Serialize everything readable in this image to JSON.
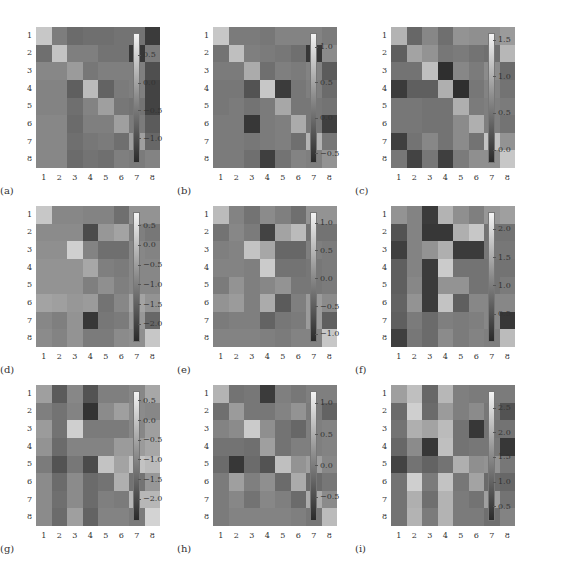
{
  "chart_data": [
    {
      "type": "heatmap",
      "label": "(a)",
      "xticks": [
        "1",
        "2",
        "3",
        "4",
        "5",
        "6",
        "7",
        "8"
      ],
      "yticks": [
        "1",
        "2",
        "3",
        "4",
        "5",
        "6",
        "7",
        "8"
      ],
      "colorbar": {
        "min": -1.4,
        "max": 0.9,
        "ticks": [
          0.5,
          0.0,
          -0.5,
          -1.0
        ],
        "tick_labels": [
          "0.5",
          "0.0",
          "−0.5",
          "−1.0"
        ]
      },
      "brightness": [
        [
          0.82,
          0.45,
          0.36,
          0.38,
          0.38,
          0.4,
          0.4,
          0.12
        ],
        [
          0.38,
          0.8,
          0.46,
          0.46,
          0.4,
          0.4,
          0.1,
          0.44
        ],
        [
          0.5,
          0.5,
          0.6,
          0.42,
          0.46,
          0.46,
          0.46,
          0.22
        ],
        [
          0.48,
          0.48,
          0.3,
          0.76,
          0.32,
          0.44,
          0.46,
          0.16
        ],
        [
          0.48,
          0.48,
          0.38,
          0.48,
          0.62,
          0.42,
          0.4,
          0.16
        ],
        [
          0.5,
          0.5,
          0.36,
          0.46,
          0.46,
          0.62,
          0.44,
          0.28
        ],
        [
          0.5,
          0.5,
          0.38,
          0.42,
          0.44,
          0.38,
          0.62,
          0.34
        ],
        [
          0.5,
          0.5,
          0.36,
          0.4,
          0.38,
          0.46,
          0.44,
          0.48
        ]
      ]
    },
    {
      "type": "heatmap",
      "label": "(b)",
      "xticks": [
        "1",
        "2",
        "3",
        "4",
        "5",
        "6",
        "7",
        "8"
      ],
      "yticks": [
        "1",
        "2",
        "3",
        "4",
        "5",
        "6",
        "7",
        "8"
      ],
      "colorbar": {
        "min": -0.6,
        "max": 1.2,
        "ticks": [
          1.0,
          0.5,
          0.0,
          -0.5
        ],
        "tick_labels": [
          "1.0",
          "0.5",
          "0.0",
          "−0.5"
        ]
      },
      "brightness": [
        [
          0.82,
          0.44,
          0.44,
          0.42,
          0.48,
          0.48,
          0.48,
          0.44
        ],
        [
          0.4,
          0.78,
          0.46,
          0.44,
          0.42,
          0.38,
          0.1,
          0.52
        ],
        [
          0.44,
          0.44,
          0.68,
          0.38,
          0.46,
          0.44,
          0.48,
          0.28
        ],
        [
          0.42,
          0.42,
          0.24,
          0.82,
          0.12,
          0.42,
          0.46,
          0.36
        ],
        [
          0.42,
          0.44,
          0.4,
          0.44,
          0.66,
          0.42,
          0.42,
          0.4
        ],
        [
          0.44,
          0.44,
          0.1,
          0.44,
          0.46,
          0.68,
          0.42,
          0.14
        ],
        [
          0.44,
          0.44,
          0.42,
          0.44,
          0.46,
          0.38,
          0.72,
          0.42
        ],
        [
          0.44,
          0.44,
          0.38,
          0.14,
          0.4,
          0.48,
          0.46,
          0.56
        ]
      ]
    },
    {
      "type": "heatmap",
      "label": "(c)",
      "xticks": [
        "1",
        "2",
        "3",
        "4",
        "5",
        "6",
        "7",
        "8"
      ],
      "yticks": [
        "1",
        "2",
        "3",
        "4",
        "5",
        "6",
        "7",
        "8"
      ],
      "colorbar": {
        "min": -0.15,
        "max": 1.6,
        "ticks": [
          1.5,
          1.0,
          0.5,
          0.0
        ],
        "tick_labels": [
          "1.5",
          "1.0",
          "0.5",
          "0.0"
        ]
      },
      "brightness": [
        [
          0.72,
          0.34,
          0.5,
          0.38,
          0.56,
          0.54,
          0.54,
          0.6
        ],
        [
          0.3,
          0.64,
          0.56,
          0.42,
          0.44,
          0.4,
          0.38,
          0.74
        ],
        [
          0.4,
          0.4,
          0.78,
          0.06,
          0.5,
          0.44,
          0.52,
          0.36
        ],
        [
          0.12,
          0.3,
          0.3,
          0.7,
          0.06,
          0.42,
          0.48,
          0.4
        ],
        [
          0.42,
          0.42,
          0.4,
          0.4,
          0.7,
          0.44,
          0.46,
          0.44
        ],
        [
          0.42,
          0.42,
          0.4,
          0.4,
          0.52,
          0.7,
          0.46,
          0.4
        ],
        [
          0.14,
          0.4,
          0.5,
          0.4,
          0.52,
          0.4,
          0.8,
          0.56
        ],
        [
          0.42,
          0.16,
          0.42,
          0.14,
          0.44,
          0.54,
          0.54,
          0.82
        ]
      ]
    },
    {
      "type": "heatmap",
      "label": "(d)",
      "xticks": [
        "1",
        "2",
        "3",
        "4",
        "5",
        "6",
        "7",
        "8"
      ],
      "yticks": [
        "1",
        "2",
        "3",
        "4",
        "5",
        "6",
        "7",
        "8"
      ],
      "colorbar": {
        "min": -2.4,
        "max": 0.85,
        "ticks": [
          0.5,
          0.0,
          -0.5,
          -1.0,
          -1.5,
          -2.0
        ],
        "tick_labels": [
          "0.5",
          "0.0",
          "−0.5",
          "−1.0",
          "−1.5",
          "−2.0"
        ]
      },
      "brightness": [
        [
          0.82,
          0.5,
          0.5,
          0.48,
          0.48,
          0.38,
          0.56,
          0.56
        ],
        [
          0.52,
          0.52,
          0.52,
          0.2,
          0.58,
          0.64,
          0.46,
          0.42
        ],
        [
          0.54,
          0.54,
          0.86,
          0.48,
          0.38,
          0.38,
          0.5,
          0.48
        ],
        [
          0.56,
          0.56,
          0.56,
          0.66,
          0.46,
          0.44,
          0.5,
          0.5
        ],
        [
          0.56,
          0.56,
          0.56,
          0.46,
          0.54,
          0.46,
          0.5,
          0.5
        ],
        [
          0.64,
          0.62,
          0.58,
          0.6,
          0.4,
          0.5,
          0.64,
          0.56
        ],
        [
          0.5,
          0.46,
          0.56,
          0.1,
          0.42,
          0.44,
          0.58,
          0.34
        ],
        [
          0.52,
          0.48,
          0.56,
          0.44,
          0.44,
          0.52,
          0.54,
          0.82
        ]
      ]
    },
    {
      "type": "heatmap",
      "label": "(e)",
      "xticks": [
        "1",
        "2",
        "3",
        "4",
        "5",
        "6",
        "7",
        "8"
      ],
      "yticks": [
        "1",
        "2",
        "3",
        "4",
        "5",
        "6",
        "7",
        "8"
      ],
      "colorbar": {
        "min": -1.1,
        "max": 1.2,
        "ticks": [
          1.0,
          0.5,
          0.0,
          -0.5,
          -1.0
        ],
        "tick_labels": [
          "1.0",
          "0.5",
          "0.0",
          "−0.5",
          "−1.0"
        ]
      },
      "brightness": [
        [
          0.76,
          0.48,
          0.4,
          0.52,
          0.46,
          0.38,
          0.56,
          0.56
        ],
        [
          0.4,
          0.5,
          0.44,
          0.16,
          0.64,
          0.76,
          0.4,
          0.4
        ],
        [
          0.46,
          0.48,
          0.8,
          0.66,
          0.34,
          0.34,
          0.46,
          0.44
        ],
        [
          0.48,
          0.48,
          0.46,
          0.84,
          0.4,
          0.4,
          0.42,
          0.44
        ],
        [
          0.44,
          0.56,
          0.46,
          0.5,
          0.56,
          0.42,
          0.42,
          0.44
        ],
        [
          0.56,
          0.6,
          0.46,
          0.68,
          0.28,
          0.46,
          0.6,
          0.52
        ],
        [
          0.44,
          0.46,
          0.46,
          0.32,
          0.42,
          0.44,
          0.6,
          0.3
        ],
        [
          0.48,
          0.48,
          0.48,
          0.46,
          0.44,
          0.48,
          0.48,
          0.82
        ]
      ]
    },
    {
      "type": "heatmap",
      "label": "(f)",
      "xticks": [
        "1",
        "2",
        "3",
        "4",
        "5",
        "6",
        "7",
        "8"
      ],
      "yticks": [
        "1",
        "2",
        "3",
        "4",
        "5",
        "6",
        "7",
        "8"
      ],
      "colorbar": {
        "min": 0.05,
        "max": 2.3,
        "ticks": [
          2.0,
          1.5,
          1.0,
          0.5
        ],
        "tick_labels": [
          "2.0",
          "1.5",
          "1.0",
          "0.5"
        ]
      },
      "brightness": [
        [
          0.56,
          0.48,
          0.12,
          0.72,
          0.54,
          0.46,
          0.58,
          0.62
        ],
        [
          0.24,
          0.48,
          0.1,
          0.1,
          0.7,
          0.82,
          0.4,
          0.4
        ],
        [
          0.14,
          0.48,
          0.56,
          0.7,
          0.12,
          0.12,
          0.42,
          0.42
        ],
        [
          0.3,
          0.48,
          0.12,
          0.84,
          0.4,
          0.4,
          0.4,
          0.4
        ],
        [
          0.3,
          0.5,
          0.12,
          0.56,
          0.56,
          0.4,
          0.4,
          0.44
        ],
        [
          0.32,
          0.56,
          0.12,
          0.8,
          0.3,
          0.5,
          0.5,
          0.5
        ],
        [
          0.3,
          0.44,
          0.36,
          0.46,
          0.44,
          0.46,
          0.5,
          0.1
        ],
        [
          0.14,
          0.42,
          0.36,
          0.52,
          0.44,
          0.48,
          0.46,
          0.76
        ]
      ]
    },
    {
      "type": "heatmap",
      "label": "(g)",
      "xticks": [
        "1",
        "2",
        "3",
        "4",
        "5",
        "6",
        "7",
        "8"
      ],
      "yticks": [
        "1",
        "2",
        "3",
        "4",
        "5",
        "6",
        "7",
        "8"
      ],
      "colorbar": {
        "min": -2.5,
        "max": 0.75,
        "ticks": [
          0.5,
          0.0,
          -0.5,
          -1.0,
          -1.5,
          -2.0
        ],
        "tick_labels": [
          "0.5",
          "0.0",
          "−0.5",
          "−1.0",
          "−1.5",
          "−2.0"
        ]
      },
      "brightness": [
        [
          0.62,
          0.28,
          0.5,
          0.24,
          0.46,
          0.46,
          0.5,
          0.66
        ],
        [
          0.46,
          0.4,
          0.48,
          0.08,
          0.52,
          0.62,
          0.52,
          0.5
        ],
        [
          0.6,
          0.4,
          0.86,
          0.44,
          0.44,
          0.44,
          0.5,
          0.62
        ],
        [
          0.56,
          0.36,
          0.48,
          0.48,
          0.48,
          0.6,
          0.6,
          0.66
        ],
        [
          0.44,
          0.24,
          0.42,
          0.2,
          0.8,
          0.64,
          0.8,
          0.76
        ],
        [
          0.52,
          0.36,
          0.52,
          0.36,
          0.4,
          0.7,
          0.4,
          0.58
        ],
        [
          0.52,
          0.38,
          0.52,
          0.36,
          0.46,
          0.44,
          0.74,
          0.74
        ],
        [
          0.52,
          0.36,
          0.62,
          0.32,
          0.48,
          0.48,
          0.44,
          0.88
        ]
      ]
    },
    {
      "type": "heatmap",
      "label": "(h)",
      "xticks": [
        "1",
        "2",
        "3",
        "4",
        "5",
        "6",
        "7",
        "8"
      ],
      "yticks": [
        "1",
        "2",
        "3",
        "4",
        "5",
        "6",
        "7",
        "8"
      ],
      "colorbar": {
        "min": -0.85,
        "max": 1.2,
        "ticks": [
          1.0,
          0.5,
          0.0,
          -0.5
        ],
        "tick_labels": [
          "1.0",
          "0.5",
          "0.0",
          "−0.5"
        ]
      },
      "brightness": [
        [
          0.72,
          0.4,
          0.42,
          0.12,
          0.46,
          0.42,
          0.46,
          0.46
        ],
        [
          0.38,
          0.6,
          0.42,
          0.42,
          0.48,
          0.56,
          0.44,
          0.32
        ],
        [
          0.48,
          0.52,
          0.84,
          0.54,
          0.4,
          0.34,
          0.46,
          0.48
        ],
        [
          0.4,
          0.4,
          0.38,
          0.62,
          0.4,
          0.46,
          0.46,
          0.48
        ],
        [
          0.36,
          0.1,
          0.36,
          0.24,
          0.78,
          0.56,
          0.62,
          0.5
        ],
        [
          0.44,
          0.62,
          0.46,
          0.54,
          0.36,
          0.68,
          0.36,
          0.42
        ],
        [
          0.44,
          0.5,
          0.4,
          0.5,
          0.46,
          0.36,
          0.68,
          0.52
        ],
        [
          0.44,
          0.48,
          0.48,
          0.48,
          0.48,
          0.46,
          0.42,
          0.76
        ]
      ]
    },
    {
      "type": "heatmap",
      "label": "(i)",
      "xticks": [
        "1",
        "2",
        "3",
        "4",
        "5",
        "6",
        "7",
        "8"
      ],
      "yticks": [
        "1",
        "2",
        "3",
        "4",
        "5",
        "6",
        "7",
        "8"
      ],
      "colorbar": {
        "min": 0.25,
        "max": 2.85,
        "ticks": [
          2.5,
          2.0,
          1.5,
          1.0,
          0.5
        ],
        "tick_labels": [
          "2.5",
          "2.0",
          "1.5",
          "1.0",
          "0.5"
        ]
      },
      "brightness": [
        [
          0.62,
          0.78,
          0.34,
          0.74,
          0.46,
          0.44,
          0.44,
          0.44
        ],
        [
          0.36,
          0.86,
          0.36,
          0.6,
          0.46,
          0.52,
          0.42,
          0.24
        ],
        [
          0.4,
          0.7,
          0.64,
          0.76,
          0.4,
          0.1,
          0.4,
          0.4
        ],
        [
          0.34,
          0.52,
          0.1,
          0.78,
          0.4,
          0.42,
          0.42,
          0.1
        ],
        [
          0.16,
          0.4,
          0.32,
          0.4,
          0.7,
          0.54,
          0.56,
          0.42
        ],
        [
          0.4,
          0.86,
          0.44,
          0.8,
          0.42,
          0.64,
          0.36,
          0.34
        ],
        [
          0.4,
          0.7,
          0.38,
          0.72,
          0.44,
          0.4,
          0.62,
          0.4
        ],
        [
          0.4,
          0.72,
          0.44,
          0.72,
          0.44,
          0.44,
          0.38,
          0.48
        ]
      ]
    }
  ]
}
